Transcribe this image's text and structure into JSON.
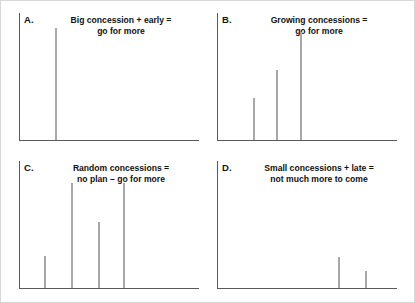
{
  "figure": {
    "background_color": "#ffffff",
    "border_color": "#d8d8d8",
    "axis_color": "#5a5a5a",
    "bar_color": "#a8a8a8"
  },
  "panels": [
    {
      "letter": "A.",
      "caption": "Big concession + early =\ngo for more"
    },
    {
      "letter": "B.",
      "caption": "Growing concessions =\ngo for more"
    },
    {
      "letter": "C.",
      "caption": "Random concessions  =\nno plan – go for more"
    },
    {
      "letter": "D.",
      "caption": "Small concessions + late =\nnot much more to come"
    }
  ],
  "chart_data": [
    {
      "type": "bar",
      "title": "Big concession + early = go for more",
      "panel": "A",
      "xlabel": "",
      "ylabel": "",
      "grid": false,
      "legend": "none",
      "xlim": [
        0,
        100
      ],
      "ylim": [
        0,
        100
      ],
      "x": [
        20
      ],
      "values": [
        88
      ],
      "categories": [
        "1"
      ]
    },
    {
      "type": "bar",
      "title": "Growing concessions = go for more",
      "panel": "B",
      "xlabel": "",
      "ylabel": "",
      "grid": false,
      "legend": "none",
      "xlim": [
        0,
        100
      ],
      "ylim": [
        0,
        100
      ],
      "x": [
        20,
        33,
        46
      ],
      "values": [
        33,
        55,
        85
      ],
      "categories": [
        "1",
        "2",
        "3"
      ]
    },
    {
      "type": "bar",
      "title": "Random concessions = no plan – go for more",
      "panel": "C",
      "xlabel": "",
      "ylabel": "",
      "grid": false,
      "legend": "none",
      "xlim": [
        0,
        100
      ],
      "ylim": [
        0,
        100
      ],
      "x": [
        14,
        29,
        44,
        58
      ],
      "values": [
        25,
        83,
        52,
        83
      ],
      "categories": [
        "1",
        "2",
        "3",
        "4"
      ]
    },
    {
      "type": "bar",
      "title": "Small concessions + late = not much more to come",
      "panel": "D",
      "xlabel": "",
      "ylabel": "",
      "grid": false,
      "legend": "none",
      "xlim": [
        0,
        100
      ],
      "ylim": [
        0,
        100
      ],
      "x": [
        67,
        82
      ],
      "values": [
        24,
        13
      ],
      "categories": [
        "1",
        "2"
      ]
    }
  ]
}
